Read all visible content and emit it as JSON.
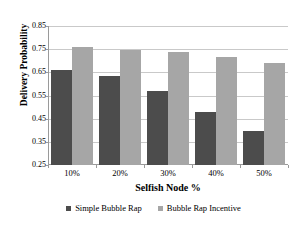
{
  "chart_data": {
    "type": "bar",
    "title": "",
    "xlabel": "Selfish Node %",
    "ylabel": "Delivery Probability",
    "categories": [
      "10%",
      "20%",
      "30%",
      "40%",
      "50%"
    ],
    "series": [
      {
        "name": "Simple Bubble Rap",
        "color": "#4c4c4c",
        "values": [
          0.66,
          0.635,
          0.568,
          0.478,
          0.395
        ]
      },
      {
        "name": "Bubble Rap Incentive",
        "color": "#a6a6a6",
        "values": [
          0.76,
          0.748,
          0.738,
          0.717,
          0.69
        ]
      }
    ],
    "ylim": [
      0.25,
      0.85
    ],
    "yticks": [
      "0.25",
      "0.35",
      "0.45",
      "0.55",
      "0.65",
      "0.75",
      "0.85"
    ],
    "ytick_values": [
      0.25,
      0.35,
      0.45,
      0.55,
      0.65,
      0.75,
      0.85
    ],
    "grid": true,
    "legend_position": "bottom"
  },
  "axes": {
    "y_title": "Delivery Probability",
    "x_title": "Selfish Node %"
  },
  "legend": {
    "items": [
      {
        "label": "Simple Bubble Rap",
        "color": "#4c4c4c"
      },
      {
        "label": "Bubble Rap Incentive",
        "color": "#a6a6a6"
      }
    ]
  }
}
